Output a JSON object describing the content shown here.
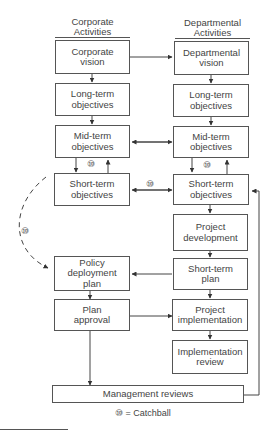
{
  "diagram": {
    "columns": {
      "left_header": "Corporate\nActivities",
      "right_header": "Departmental\nActivities"
    },
    "left_boxes": {
      "corporate_vision": "Corporate\nvision",
      "long_term": "Long-term\nobjectives",
      "mid_term": "Mid-term\nobjectives",
      "short_term": "Short-term\nobjectives",
      "policy_deployment": "Policy\ndeployment\nplan",
      "plan_approval": "Plan\napproval"
    },
    "right_boxes": {
      "departmental_vision": "Departmental\nvision",
      "long_term": "Long-term\nobjectives",
      "mid_term": "Mid-term\nobjectives",
      "short_term": "Short-term\nobjectives",
      "project_development": "Project\ndevelopment",
      "short_term_plan": "Short-term\nplan",
      "project_implementation": "Project\nimplementation",
      "implementation_review": "Implementation\nreview"
    },
    "bottom_box": "Management reviews",
    "catchball_symbol": "⑩",
    "legend": "= Catchball"
  }
}
